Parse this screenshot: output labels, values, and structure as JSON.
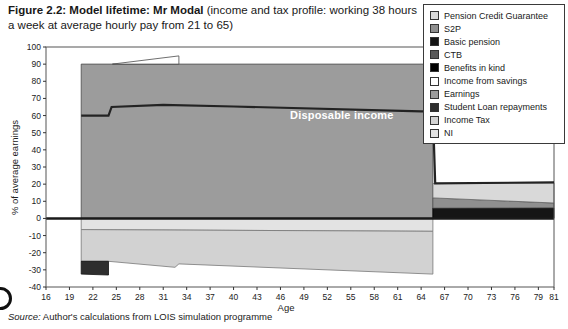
{
  "figure": {
    "title_bold": "Figure 2.2: Model lifetime: Mr Modal",
    "title_rest": " (income and tax profile: working 38 hours a week at average hourly pay from 21 to 65)"
  },
  "source": {
    "prefix": "Source:",
    "text": " Author's calculations from LOIS simulation programme"
  },
  "chart_data": {
    "type": "area",
    "stacked": true,
    "title": "Model lifetime: Mr Modal (income and tax profile: working 38 hours a week at average hourly pay from 21 to 65)",
    "xlabel": "Age",
    "ylabel": "% of average earnings",
    "xlim": [
      16,
      81
    ],
    "ylim": [
      -40,
      100
    ],
    "grid": false,
    "legend_position": "top-right",
    "xticks": [
      16,
      19,
      22,
      25,
      28,
      31,
      34,
      37,
      40,
      43,
      46,
      49,
      52,
      55,
      58,
      61,
      64,
      67,
      70,
      73,
      76,
      79,
      81
    ],
    "yticks": [
      -40,
      -30,
      -20,
      -10,
      0,
      10,
      20,
      30,
      40,
      50,
      60,
      70,
      80,
      90,
      100
    ],
    "annotation": "Disposable income",
    "bands": [
      {
        "name": "Earnings",
        "color": "#9c9c9c",
        "edge": "#4a4a4a",
        "points": [
          [
            20.5,
            0
          ],
          [
            20.5,
            90
          ],
          [
            65.5,
            90
          ],
          [
            65.5,
            0
          ]
        ]
      },
      {
        "name": "Income from savings",
        "color": "#ffffff",
        "edge": "#4a4a4a",
        "points": [
          [
            24.5,
            90
          ],
          [
            33,
            94.8
          ],
          [
            33,
            90
          ]
        ]
      },
      {
        "name": "NI",
        "color": "#e3e3e3",
        "edge": "#777777",
        "points": [
          [
            20.5,
            0
          ],
          [
            65.5,
            0
          ],
          [
            65.5,
            -7.5
          ],
          [
            20.5,
            -6.5
          ]
        ]
      },
      {
        "name": "Income Tax",
        "color": "#d2d2d2",
        "edge": "#777777",
        "points": [
          [
            20.5,
            -6.5
          ],
          [
            65.5,
            -7.5
          ],
          [
            65.5,
            -32.5
          ],
          [
            33,
            -26.5
          ],
          [
            32.5,
            -28.5
          ],
          [
            24,
            -25
          ],
          [
            20.5,
            -25
          ]
        ]
      },
      {
        "name": "Student Loan repayments",
        "color": "#2e2e2e",
        "edge": "#111111",
        "points": [
          [
            20.5,
            -25
          ],
          [
            24,
            -25
          ],
          [
            24,
            -33
          ],
          [
            20.5,
            -32.5
          ]
        ]
      },
      {
        "name": "Basic pension",
        "color": "#151515",
        "edge": "#000000",
        "points": [
          [
            65.5,
            0
          ],
          [
            65.5,
            6
          ],
          [
            81,
            6.2
          ],
          [
            81,
            0
          ]
        ]
      },
      {
        "name": "S2P",
        "color": "#8f8f8f",
        "edge": "#555555",
        "points": [
          [
            65.5,
            6
          ],
          [
            65.5,
            12
          ],
          [
            81,
            9
          ],
          [
            81,
            6.2
          ]
        ]
      },
      {
        "name": "Pension Credit Guarantee",
        "color": "#d9d9d9",
        "edge": "#666666",
        "points": [
          [
            65.5,
            12
          ],
          [
            65.5,
            20.3
          ],
          [
            81,
            20.8
          ],
          [
            81,
            9
          ]
        ]
      }
    ],
    "line": {
      "name": "Disposable income",
      "color": "#232323",
      "points": [
        [
          20.5,
          60
        ],
        [
          24,
          60
        ],
        [
          24.4,
          65
        ],
        [
          31,
          66.2
        ],
        [
          40,
          65.3
        ],
        [
          64,
          62.5
        ],
        [
          65.5,
          62.5
        ],
        [
          65.8,
          20.5
        ],
        [
          81,
          21
        ]
      ]
    }
  },
  "legend": {
    "items": [
      {
        "label": "Pension Credit Guarantee",
        "color": "#d9d9d9"
      },
      {
        "label": "S2P",
        "color": "#8f8f8f"
      },
      {
        "label": "Basic pension",
        "color": "#151515"
      },
      {
        "label": "CTB",
        "color": "#5a5a5a"
      },
      {
        "label": "Benefits in kind",
        "color": "#000000"
      },
      {
        "label": "Income from savings",
        "color": "#ffffff"
      },
      {
        "label": "Earnings",
        "color": "#9c9c9c"
      },
      {
        "label": "Student Loan repayments",
        "color": "#2e2e2e"
      },
      {
        "label": "Income Tax",
        "color": "#d2d2d2"
      },
      {
        "label": "NI",
        "color": "#e3e3e3"
      }
    ]
  }
}
